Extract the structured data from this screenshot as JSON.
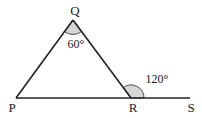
{
  "diagram": {
    "type": "geometry-triangle",
    "points": {
      "P": {
        "label": "P",
        "x": 16,
        "y": 98
      },
      "Q": {
        "label": "Q",
        "x": 73,
        "y": 20
      },
      "R": {
        "label": "R",
        "x": 131,
        "y": 98
      },
      "S": {
        "label": "S",
        "x": 190,
        "y": 98
      }
    },
    "angles": {
      "Q": {
        "label": "60°",
        "vertex": "Q",
        "between": [
          "P",
          "R"
        ]
      },
      "exterior_R": {
        "label": "120°",
        "vertex": "R",
        "between": [
          "Q",
          "S"
        ]
      }
    },
    "colors": {
      "line": "#222222",
      "angle_fill": "#d6d6d6"
    }
  }
}
